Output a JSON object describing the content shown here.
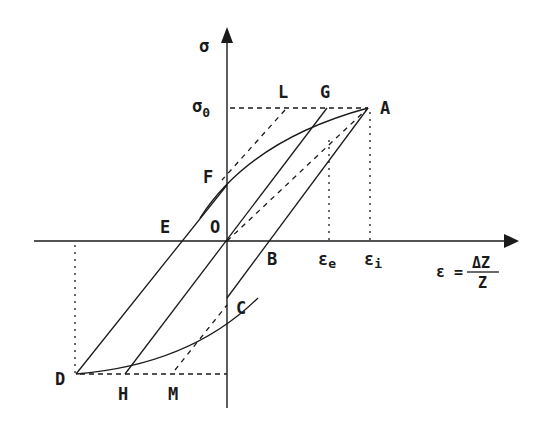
{
  "diagram": {
    "type": "stress-strain hysteresis loop",
    "axes": {
      "y_label": "σ",
      "y_level_label": "σ",
      "y_level_sub": "0",
      "x_label_lhs": "ε =",
      "x_label_num": "ΔZ",
      "x_label_den": "Z",
      "x_tick_e": "ε",
      "x_tick_e_sub": "e",
      "x_tick_i": "ε",
      "x_tick_i_sub": "i"
    },
    "points": {
      "A": "A",
      "B": "B",
      "C": "C",
      "D": "D",
      "E": "E",
      "F": "F",
      "G": "G",
      "H": "H",
      "L": "L",
      "M": "M",
      "O": "O"
    },
    "colors": {
      "line": "#1a1a1a",
      "background": "#ffffff"
    }
  }
}
